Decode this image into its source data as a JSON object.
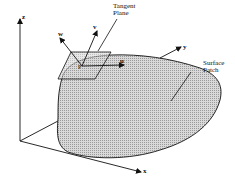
{
  "figure": {
    "axes": {
      "x_label": "x",
      "y_label": "y",
      "z_label": "z"
    },
    "vectors": {
      "u_label": "u",
      "v_label": "v",
      "w_label": "w",
      "point_label": "P"
    },
    "annotations": {
      "tangent_plane": "Tangent\nPlane",
      "surface_patch": "Surface\nPatch"
    },
    "colors": {
      "stroke": "#111111",
      "patch_fill": "#c8c8c8",
      "background": "#ffffff"
    }
  }
}
